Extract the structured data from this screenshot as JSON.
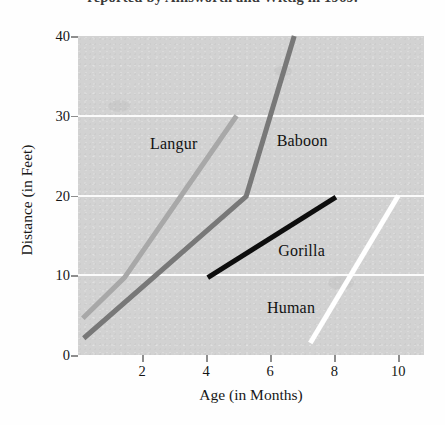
{
  "figure": {
    "caption_remnant": "reported by Ainsworth and Wittig in 1969.",
    "background_color": "#fefefe",
    "plot_background_color": "#d2d2d2",
    "gridline_color": "#fdfdfd"
  },
  "chart_data": {
    "type": "line",
    "title": "",
    "subtitle": "",
    "xlabel": "Age (in Months)",
    "ylabel": "Distance (in Feet)",
    "xlim": [
      0,
      10.8
    ],
    "ylim": [
      0,
      40
    ],
    "x_ticks": [
      2,
      4,
      6,
      8,
      10
    ],
    "y_ticks": [
      0,
      10,
      20,
      30,
      40
    ],
    "x_tick_labels": [
      "2",
      "4",
      "6",
      "8",
      "10"
    ],
    "y_tick_labels": [
      "0",
      "10",
      "20",
      "30",
      "40"
    ],
    "grid": "horizontal-only",
    "legend": "inline-labels",
    "series": [
      {
        "name": "Langur",
        "color": "#a8a8a8",
        "stroke_width": 5,
        "label_position": {
          "x": 2.25,
          "y": 26.5
        },
        "points": [
          {
            "x": 0.15,
            "y": 4.6
          },
          {
            "x": 1.45,
            "y": 9.7
          },
          {
            "x": 4.95,
            "y": 30.0
          }
        ]
      },
      {
        "name": "Baboon",
        "color": "#787878",
        "stroke_width": 5,
        "label_position": {
          "x": 6.2,
          "y": 26.8
        },
        "points": [
          {
            "x": 0.18,
            "y": 2.1
          },
          {
            "x": 5.25,
            "y": 19.9
          },
          {
            "x": 6.75,
            "y": 40.0
          }
        ]
      },
      {
        "name": "Gorilla",
        "color": "#0d0d0d",
        "stroke_width": 5,
        "label_position": {
          "x": 6.25,
          "y": 13.0
        },
        "points": [
          {
            "x": 4.05,
            "y": 9.7
          },
          {
            "x": 8.05,
            "y": 19.8
          }
        ]
      },
      {
        "name": "Human",
        "color": "#ffffff",
        "stroke_width": 5,
        "label_position": {
          "x": 5.9,
          "y": 5.9
        },
        "points": [
          {
            "x": 7.25,
            "y": 1.5
          },
          {
            "x": 10.0,
            "y": 20.0
          }
        ]
      }
    ]
  }
}
